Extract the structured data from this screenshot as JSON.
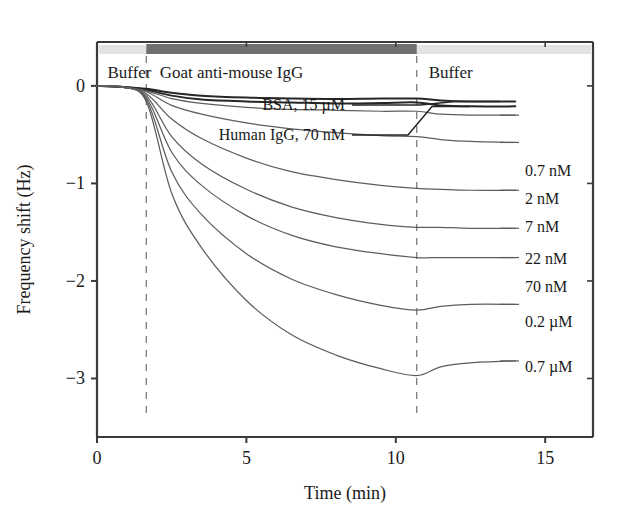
{
  "chart_data": {
    "type": "line",
    "title": "",
    "xlabel": "Time (min)",
    "ylabel": "Frequency shift (Hz)",
    "xlim": [
      0,
      16.6
    ],
    "ylim": [
      -3.6,
      0.45
    ],
    "xticks": [
      0,
      5,
      10,
      15
    ],
    "xticklabels": [
      "0",
      "5",
      "10",
      "15"
    ],
    "yticks": [
      0,
      -1,
      -2,
      -3
    ],
    "yticklabels": [
      "0",
      "-1",
      "-2",
      "-3"
    ],
    "grid": false,
    "legend_position": "right-inline-labels",
    "phase_markers": [
      {
        "label": "Buffer",
        "x_start": 0.0,
        "x_end": 1.65
      },
      {
        "label": "Goat anti-mouse IgG",
        "x_start": 1.65,
        "x_end": 10.7
      },
      {
        "label": "Buffer",
        "x_start": 10.7,
        "x_end": 16.6
      }
    ],
    "injection_time": 1.65,
    "rinse_time": 10.7,
    "annotations": [
      {
        "text": "BSA, 15 µM",
        "target_series": "BSA, 15 µM"
      },
      {
        "text": "Human IgG, 70 nM",
        "target_series": "Human IgG, 70 nM"
      }
    ],
    "series": [
      {
        "name": "BSA, 15 µM",
        "label": "BSA, 15 µM",
        "control": true,
        "plateau": -0.13,
        "final": -0.16,
        "points": [
          [
            0,
            0
          ],
          [
            0.8,
            -0.01
          ],
          [
            1.65,
            -0.03
          ],
          [
            2.5,
            -0.07
          ],
          [
            3.5,
            -0.1
          ],
          [
            5,
            -0.12
          ],
          [
            6.5,
            -0.13
          ],
          [
            8,
            -0.135
          ],
          [
            9.5,
            -0.13
          ],
          [
            10.7,
            -0.13
          ],
          [
            11.5,
            -0.15
          ],
          [
            12.5,
            -0.16
          ],
          [
            14,
            -0.16
          ]
        ]
      },
      {
        "name": "Human IgG, 70 nM",
        "label": "Human IgG, 70 nM",
        "control": true,
        "plateau": -0.17,
        "final": -0.21,
        "points": [
          [
            0,
            0
          ],
          [
            0.8,
            -0.01
          ],
          [
            1.65,
            -0.04
          ],
          [
            2.5,
            -0.1
          ],
          [
            3.5,
            -0.14
          ],
          [
            5,
            -0.16
          ],
          [
            6.5,
            -0.17
          ],
          [
            8,
            -0.18
          ],
          [
            9.5,
            -0.175
          ],
          [
            10.7,
            -0.17
          ],
          [
            11.5,
            -0.2
          ],
          [
            12.5,
            -0.21
          ],
          [
            14,
            -0.21
          ]
        ]
      },
      {
        "name": "0.7 nM",
        "label": "0.7 nM",
        "control": false,
        "plateau": -0.26,
        "final": -0.3,
        "points": [
          [
            0,
            0
          ],
          [
            0.8,
            -0.01
          ],
          [
            1.65,
            -0.05
          ],
          [
            2.5,
            -0.13
          ],
          [
            3.5,
            -0.18
          ],
          [
            5,
            -0.22
          ],
          [
            6.5,
            -0.24
          ],
          [
            8,
            -0.25
          ],
          [
            9.5,
            -0.26
          ],
          [
            10.7,
            -0.26
          ],
          [
            11.5,
            -0.29
          ],
          [
            12.5,
            -0.3
          ],
          [
            14,
            -0.3
          ]
        ]
      },
      {
        "name": "2 nM",
        "label": "2 nM",
        "control": false,
        "plateau": -0.52,
        "final": -0.58,
        "points": [
          [
            0,
            0
          ],
          [
            0.8,
            -0.01
          ],
          [
            1.65,
            -0.06
          ],
          [
            2.5,
            -0.2
          ],
          [
            3.5,
            -0.29
          ],
          [
            5,
            -0.38
          ],
          [
            6.5,
            -0.44
          ],
          [
            8,
            -0.48
          ],
          [
            9.5,
            -0.51
          ],
          [
            10.7,
            -0.52
          ],
          [
            11.5,
            -0.55
          ],
          [
            12.5,
            -0.57
          ],
          [
            14,
            -0.58
          ]
        ]
      },
      {
        "name": "7 nM",
        "label": "7 nM",
        "control": false,
        "plateau": -1.05,
        "final": -1.07,
        "points": [
          [
            0,
            0
          ],
          [
            0.8,
            -0.01
          ],
          [
            1.65,
            -0.08
          ],
          [
            2.5,
            -0.34
          ],
          [
            3.5,
            -0.54
          ],
          [
            5,
            -0.74
          ],
          [
            6.5,
            -0.88
          ],
          [
            8,
            -0.96
          ],
          [
            9.5,
            -1.02
          ],
          [
            10.7,
            -1.05
          ],
          [
            11.5,
            -1.06
          ],
          [
            12.5,
            -1.07
          ],
          [
            14,
            -1.07
          ]
        ]
      },
      {
        "name": "22 nM",
        "label": "22 nM",
        "control": false,
        "plateau": -1.45,
        "final": -1.46,
        "points": [
          [
            0,
            0
          ],
          [
            0.8,
            -0.01
          ],
          [
            1.65,
            -0.1
          ],
          [
            2.5,
            -0.52
          ],
          [
            3.5,
            -0.8
          ],
          [
            5,
            -1.06
          ],
          [
            6.5,
            -1.24
          ],
          [
            8,
            -1.35
          ],
          [
            9.5,
            -1.42
          ],
          [
            10.7,
            -1.45
          ],
          [
            11.5,
            -1.45
          ],
          [
            12.5,
            -1.46
          ],
          [
            14,
            -1.46
          ]
        ]
      },
      {
        "name": "70 nM",
        "label": "70 nM",
        "control": false,
        "plateau": -1.76,
        "final": -1.76,
        "points": [
          [
            0,
            0
          ],
          [
            0.8,
            -0.01
          ],
          [
            1.65,
            -0.12
          ],
          [
            2.5,
            -0.68
          ],
          [
            3.5,
            -1.02
          ],
          [
            5,
            -1.33
          ],
          [
            6.5,
            -1.53
          ],
          [
            8,
            -1.65
          ],
          [
            9.5,
            -1.72
          ],
          [
            10.7,
            -1.76
          ],
          [
            11.5,
            -1.76
          ],
          [
            12.5,
            -1.76
          ],
          [
            14,
            -1.76
          ]
        ]
      },
      {
        "name": "0.2 µM",
        "label": "0.2 µM",
        "control": false,
        "plateau": -2.3,
        "final": -2.24,
        "points": [
          [
            0,
            0
          ],
          [
            0.8,
            -0.01
          ],
          [
            1.65,
            -0.14
          ],
          [
            2.5,
            -0.88
          ],
          [
            3.5,
            -1.32
          ],
          [
            5,
            -1.72
          ],
          [
            6.5,
            -1.98
          ],
          [
            8,
            -2.14
          ],
          [
            9.5,
            -2.25
          ],
          [
            10.7,
            -2.3
          ],
          [
            11.5,
            -2.26
          ],
          [
            12.5,
            -2.24
          ],
          [
            14,
            -2.24
          ]
        ]
      },
      {
        "name": "0.7 µM",
        "label": "0.7 µM",
        "control": false,
        "plateau": -2.97,
        "final": -2.82,
        "points": [
          [
            0,
            0
          ],
          [
            0.8,
            -0.01
          ],
          [
            1.65,
            -0.16
          ],
          [
            2.5,
            -1.1
          ],
          [
            3.5,
            -1.66
          ],
          [
            5,
            -2.2
          ],
          [
            6.5,
            -2.55
          ],
          [
            8,
            -2.76
          ],
          [
            9.5,
            -2.9
          ],
          [
            10.7,
            -2.97
          ],
          [
            11.5,
            -2.88
          ],
          [
            12.5,
            -2.84
          ],
          [
            14,
            -2.82
          ]
        ]
      }
    ],
    "right_labels": [
      {
        "text": "0.7 nM",
        "y_value": -0.3
      },
      {
        "text": "2 nM",
        "y_value": -0.58
      },
      {
        "text": "7 nM",
        "y_value": -1.07
      },
      {
        "text": "22 nM",
        "y_value": -1.46
      },
      {
        "text": "70 nM",
        "y_value": -1.76
      },
      {
        "text": "0.2 µM",
        "y_value": -2.24
      },
      {
        "text": "0.7 µM",
        "y_value": -2.82
      }
    ],
    "colors": {
      "curve": "#5d5d5d",
      "control_curve": "#262626",
      "axis": "#3a3a3a",
      "bar_light": "#e2e2e2",
      "bar_dark": "#6f6f6f",
      "dashline": "#7b7b7b",
      "background": "#ffffff"
    }
  }
}
